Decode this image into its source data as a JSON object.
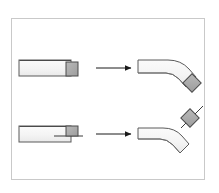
{
  "figure": {
    "title": "Beam bending comparison",
    "background_color": "#ffffff",
    "frame": {
      "border_color": "#c9c9c9",
      "fill_color": "#ffffff",
      "x": 11,
      "y": 18,
      "width": 194,
      "height": 162
    },
    "palette": {
      "beam_fill": "#f2f2f2",
      "beam_fill_light": "#fafafa",
      "beam_stroke": "#5a5a5a",
      "block_fill": "#a9a9a9",
      "block_stroke": "#4a4a4a",
      "arrow_color": "#1a1a1a",
      "neutral_line_color": "#3a3a3a"
    },
    "rows": [
      {
        "id": "row-top",
        "label": "Top case: block attached at beam upper surface",
        "before": {
          "label": "Straight beam with end block on top face",
          "beam": {
            "x": 19,
            "y": 60,
            "width": 52,
            "height": 16
          },
          "block": {
            "x": 66,
            "y": 62,
            "width": 12,
            "height": 14,
            "attachment": "upper-face"
          }
        },
        "arrow": {
          "label": "transforms to",
          "x1": 96,
          "y1": 68,
          "x2": 133,
          "y2": 68,
          "head_size": 5
        },
        "after": {
          "label": "Bent beam, block rotated to diamond orientation below the bend",
          "bend_angle_deg": 45,
          "block": {
            "cx": 192,
            "cy": 83,
            "size": 13,
            "rotation_deg": 45
          }
        }
      },
      {
        "id": "row-bottom",
        "label": "Bottom case: block attached at beam neutral axis",
        "before": {
          "label": "Straight beam with end block on mid-plane and neutral-axis line",
          "beam": {
            "x": 19,
            "y": 126,
            "width": 52,
            "height": 16
          },
          "block": {
            "x": 66,
            "y": 126,
            "width": 12,
            "height": 10,
            "attachment": "mid-plane"
          },
          "neutral_line": {
            "x1": 54,
            "y1": 136,
            "x2": 82,
            "y2": 136
          }
        },
        "arrow": {
          "label": "transforms to",
          "x1": 96,
          "y1": 134,
          "x2": 133,
          "y2": 134,
          "head_size": 5
        },
        "after": {
          "label": "Bent beam, block rotated to diamond orientation above the bend with tangent line",
          "bend_angle_deg": 45,
          "block": {
            "cx": 190,
            "cy": 118,
            "size": 13,
            "rotation_deg": 45
          },
          "tangent_line": {
            "x1": 182,
            "y1": 126,
            "x2": 203,
            "y2": 105
          }
        }
      }
    ]
  }
}
